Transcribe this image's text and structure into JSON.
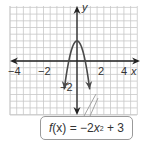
{
  "chart_data": {
    "type": "line",
    "title": "",
    "function_label": "f(x) = −2x² + 3",
    "function": {
      "name": "f",
      "a": -2,
      "b": 0,
      "c": 3
    },
    "xlabel": "x",
    "ylabel": "y",
    "xlim": [
      -5,
      4.5
    ],
    "ylim": [
      -5,
      4
    ],
    "x_ticks": [
      -4,
      -2,
      2,
      4
    ],
    "x_tick_labels": [
      "−4",
      "−2",
      "2",
      "4"
    ],
    "y_ticks": [
      -2
    ],
    "y_tick_labels": [
      "−2"
    ],
    "grid": true,
    "grid_step": 1,
    "vertex": [
      0,
      3
    ],
    "x_intercepts": [
      -1.22,
      1.22
    ],
    "series": [
      {
        "name": "f(x) = −2x² + 3",
        "x": [
          -1.9,
          -1.5,
          -1.0,
          -0.5,
          0,
          0.5,
          1.0,
          1.5,
          1.9
        ],
        "y": [
          -4.22,
          -1.5,
          1,
          2.5,
          3,
          2.5,
          1,
          -1.5,
          -4.22
        ]
      }
    ],
    "colors": {
      "curve": "#4a4a4a",
      "axes": "#222222",
      "grid": "#c8c8c8"
    }
  },
  "labels": {
    "x_axis": "x",
    "y_axis": "y",
    "tick_neg4": "−4",
    "tick_neg2": "−2",
    "tick_2": "2",
    "tick_4": "4",
    "tick_y_neg2": "−2"
  },
  "callout": {
    "f": "f",
    "x_paren": "(x)",
    "equals": " = −2",
    "x": "x",
    "exp": "2",
    "rest": " + 3"
  }
}
